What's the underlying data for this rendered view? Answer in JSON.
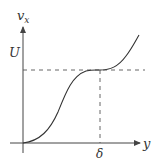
{
  "figure": {
    "axis_labels": {
      "vertical": "v",
      "vertical_subscript": "x",
      "horizontal": "y"
    },
    "markers": {
      "level_label": "U",
      "position_label": "δ"
    }
  },
  "colors": {
    "curve": "#333333",
    "axis": "#444444",
    "dashed": "#555555",
    "background": "#ffffff"
  }
}
